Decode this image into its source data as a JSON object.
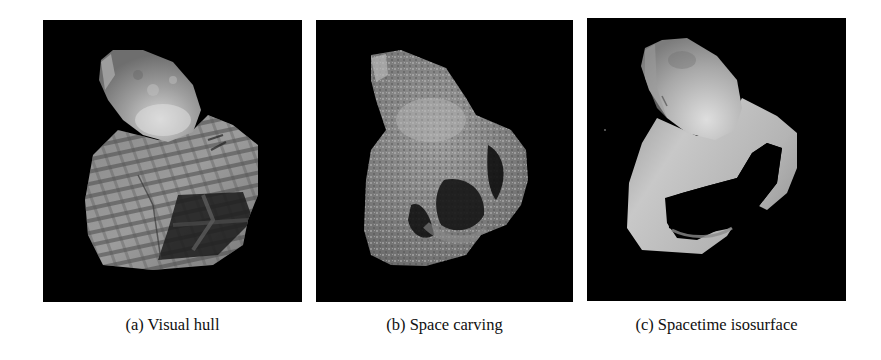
{
  "figure": {
    "background": "#ffffff",
    "panels": [
      {
        "id": "a",
        "label": "(a) Visual hull",
        "render": "blocky striped gray surface with dark cross-hatched region lower right",
        "background": "#000000"
      },
      {
        "id": "b",
        "label": "(b) Space carving",
        "render": "noisy speckled gray surface with carved dark cavities",
        "background": "#000000"
      },
      {
        "id": "c",
        "label": "(c) Spacetime isosurface",
        "render": "smooth shaded light gray surface with large dark hole",
        "background": "#000000"
      }
    ]
  }
}
